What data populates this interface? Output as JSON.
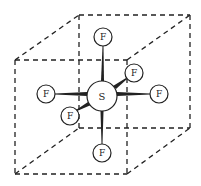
{
  "molecule": {
    "name": "sulfur hexafluoride",
    "geometry": "octahedral",
    "central_atom": {
      "symbol": "S",
      "x": 102,
      "y": 96,
      "r": 15
    },
    "ligands": [
      {
        "id": "top",
        "symbol": "F",
        "x": 103,
        "y": 37,
        "r": 9
      },
      {
        "id": "bottom",
        "symbol": "F",
        "x": 102,
        "y": 153,
        "r": 9
      },
      {
        "id": "left",
        "symbol": "F",
        "x": 46,
        "y": 94,
        "r": 9
      },
      {
        "id": "right",
        "symbol": "F",
        "x": 159,
        "y": 94,
        "r": 9
      },
      {
        "id": "back-right",
        "symbol": "F",
        "x": 134,
        "y": 73,
        "r": 9
      },
      {
        "id": "front-left",
        "symbol": "F",
        "x": 70,
        "y": 116,
        "r": 9
      }
    ]
  },
  "cube": {
    "front_face": {
      "x1": 15,
      "y1": 60,
      "x2": 127,
      "y2": 174
    },
    "back_face": {
      "x1": 79,
      "y1": 15,
      "x2": 190,
      "y2": 128
    }
  },
  "colors": {
    "line": "#222222",
    "background": "#ffffff"
  }
}
